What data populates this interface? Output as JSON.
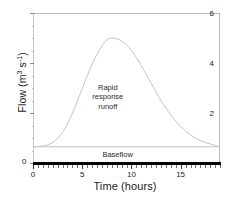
{
  "chart_data": {
    "type": "line",
    "title": "",
    "xlabel": "Time (hours)",
    "ylabel": "Flow (m",
    "ylabel_unit_sup1": "3",
    "ylabel_mid": " s",
    "ylabel_unit_sup2": "-1",
    "ylabel_end": ")",
    "ylabel_plain": "Flow (m3 s-1)",
    "xlim": [
      0,
      19
    ],
    "ylim": [
      0,
      6
    ],
    "grid": false,
    "legend": "none",
    "x_ticks_major": [
      0,
      5,
      10,
      15
    ],
    "x_tick_labels": [
      "0",
      "5",
      "10",
      "15"
    ],
    "x_tick_minor_step": 0.5,
    "y_ticks_major": [
      0,
      2,
      4,
      6
    ],
    "y_tick_labels": [
      "0",
      "2",
      "4",
      "6"
    ],
    "y_tick_minor_step": 0.5,
    "series": [
      {
        "name": "Total hydrograph",
        "color": "#c4c4c4",
        "x": [
          0,
          0.5,
          1,
          1.5,
          2,
          2.5,
          3,
          3.5,
          4,
          4.5,
          5,
          5.5,
          6,
          6.5,
          7,
          7.5,
          8,
          8.5,
          9,
          9.5,
          10,
          10.5,
          11,
          11.5,
          12,
          12.5,
          13,
          13.5,
          14,
          14.5,
          15,
          15.5,
          16,
          16.5,
          17,
          17.5,
          18,
          18.5,
          19
        ],
        "values": [
          0.65,
          0.66,
          0.68,
          0.73,
          0.82,
          0.98,
          1.22,
          1.56,
          1.98,
          2.46,
          2.98,
          3.48,
          3.94,
          4.34,
          4.68,
          4.92,
          5.0,
          4.97,
          4.88,
          4.72,
          4.5,
          4.22,
          3.9,
          3.55,
          3.2,
          2.85,
          2.5,
          2.2,
          1.92,
          1.68,
          1.46,
          1.28,
          1.12,
          1.0,
          0.9,
          0.82,
          0.76,
          0.71,
          0.67
        ]
      },
      {
        "name": "Baseflow",
        "color": "#c4c4c4",
        "x": [
          0,
          19
        ],
        "values": [
          0.65,
          0.65
        ]
      }
    ],
    "annotations": [
      {
        "text_lines": [
          "Rapid",
          "response",
          "runoff"
        ],
        "x": 7.6,
        "y": 2.65
      },
      {
        "text_lines": [
          "Baseflow"
        ],
        "x": 8.6,
        "y": 0.33
      }
    ]
  },
  "axis_titles": {
    "x": "Time (hours)"
  },
  "colors": {
    "curve": "#c4c4c4",
    "baseflow": "#c4c4c4",
    "frame": "#b9b9b9",
    "axis": "#000000",
    "text": "#1a1a1a"
  }
}
